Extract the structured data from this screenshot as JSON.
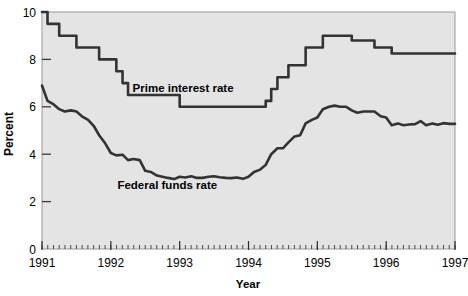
{
  "chart_data": {
    "type": "line",
    "title": "",
    "xlabel": "Year",
    "ylabel": "Percent",
    "xlim": [
      1991,
      1997
    ],
    "ylim": [
      0,
      10
    ],
    "ytick_values": [
      0,
      2,
      4,
      6,
      8,
      10
    ],
    "ytick_labels": [
      "0",
      "2",
      "4",
      "6",
      "8",
      "10"
    ],
    "xtick_values": [
      1991,
      1992,
      1993,
      1994,
      1995,
      1996,
      1997
    ],
    "xtick_labels": [
      "1991",
      "1992",
      "1993",
      "1994",
      "1995",
      "1996",
      "1997"
    ],
    "minor_ticks": "monthly",
    "grid": false,
    "legend_position": "inline-annotations",
    "plot_background": "#e4e4e4",
    "line_color": "#333333",
    "series": [
      {
        "name": "Prime interest rate",
        "label_x": 1993.05,
        "label_y": 6.62,
        "style": "step",
        "x": [
          1991.0,
          1991.08,
          1991.17,
          1991.25,
          1991.33,
          1991.42,
          1991.5,
          1991.58,
          1991.67,
          1991.75,
          1991.83,
          1991.92,
          1992.0,
          1992.08,
          1992.17,
          1992.25,
          1992.33,
          1992.42,
          1992.5,
          1992.58,
          1992.67,
          1992.75,
          1992.83,
          1992.92,
          1993.0,
          1993.25,
          1993.5,
          1993.75,
          1994.0,
          1994.17,
          1994.25,
          1994.33,
          1994.42,
          1994.5,
          1994.58,
          1994.67,
          1994.83,
          1994.92,
          1995.0,
          1995.08,
          1995.17,
          1995.25,
          1995.33,
          1995.5,
          1995.58,
          1995.67,
          1995.75,
          1995.83,
          1995.92,
          1996.0,
          1996.08,
          1996.17,
          1996.25,
          1996.5,
          1996.75,
          1997.0
        ],
        "values": [
          10.0,
          9.5,
          9.5,
          9.0,
          9.0,
          9.0,
          8.5,
          8.5,
          8.5,
          8.5,
          8.0,
          8.0,
          8.0,
          7.5,
          7.0,
          6.5,
          6.5,
          6.5,
          6.5,
          6.5,
          6.5,
          6.5,
          6.5,
          6.5,
          6.0,
          6.0,
          6.0,
          6.0,
          6.0,
          6.0,
          6.25,
          6.75,
          7.25,
          7.25,
          7.75,
          7.75,
          8.5,
          8.5,
          8.5,
          9.0,
          9.0,
          9.0,
          9.0,
          8.8,
          8.8,
          8.8,
          8.8,
          8.5,
          8.5,
          8.5,
          8.25,
          8.25,
          8.25,
          8.25,
          8.25,
          8.25
        ]
      },
      {
        "name": "Federal funds rate",
        "label_x": 1992.82,
        "label_y": 2.52,
        "style": "line",
        "x": [
          1991.0,
          1991.08,
          1991.17,
          1991.25,
          1991.33,
          1991.42,
          1991.5,
          1991.58,
          1991.67,
          1991.75,
          1991.83,
          1991.92,
          1992.0,
          1992.08,
          1992.17,
          1992.25,
          1992.33,
          1992.42,
          1992.5,
          1992.58,
          1992.67,
          1992.75,
          1992.83,
          1992.92,
          1993.0,
          1993.08,
          1993.17,
          1993.25,
          1993.33,
          1993.42,
          1993.5,
          1993.58,
          1993.67,
          1993.75,
          1993.83,
          1993.92,
          1994.0,
          1994.08,
          1994.17,
          1994.25,
          1994.33,
          1994.42,
          1994.5,
          1994.58,
          1994.67,
          1994.75,
          1994.83,
          1994.92,
          1995.0,
          1995.08,
          1995.17,
          1995.25,
          1995.33,
          1995.42,
          1995.5,
          1995.58,
          1995.67,
          1995.75,
          1995.83,
          1995.92,
          1996.0,
          1996.08,
          1996.17,
          1996.25,
          1996.33,
          1996.42,
          1996.5,
          1996.58,
          1996.67,
          1996.75,
          1996.83,
          1996.92,
          1997.0
        ],
        "values": [
          6.9,
          6.25,
          6.1,
          5.9,
          5.8,
          5.85,
          5.8,
          5.6,
          5.45,
          5.2,
          4.8,
          4.45,
          4.05,
          3.95,
          3.98,
          3.75,
          3.8,
          3.75,
          3.3,
          3.25,
          3.1,
          3.05,
          3.0,
          2.95,
          3.05,
          3.02,
          3.07,
          3.0,
          3.0,
          3.05,
          3.07,
          3.03,
          3.0,
          2.99,
          3.02,
          2.96,
          3.05,
          3.25,
          3.35,
          3.55,
          4.0,
          4.25,
          4.25,
          4.5,
          4.75,
          4.8,
          5.3,
          5.45,
          5.55,
          5.9,
          6.0,
          6.05,
          6.0,
          6.0,
          5.85,
          5.75,
          5.8,
          5.8,
          5.8,
          5.6,
          5.55,
          5.22,
          5.3,
          5.22,
          5.25,
          5.27,
          5.4,
          5.22,
          5.3,
          5.24,
          5.31,
          5.28,
          5.28
        ]
      }
    ]
  }
}
